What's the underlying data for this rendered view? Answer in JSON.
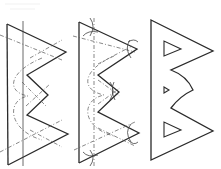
{
  "diagram": {
    "colors": {
      "stroke": "#2a2a2a",
      "guide": "#444444",
      "dashed": "#555555",
      "background": "#ffffff"
    },
    "figures": [
      {
        "id": "step-1",
        "label": "construction-lines",
        "outline": "7,24 66,52 27,75 48,95 27,115 68,134 8,165",
        "vertical_lines": [
          [
            7,
            24,
            8,
            165
          ],
          [
            23,
            22,
            23,
            165
          ]
        ],
        "dashed_diagonals": [
          [
            0,
            35,
            62,
            60
          ],
          [
            30,
            58,
            62,
            42
          ],
          [
            20,
            82,
            44,
            106
          ],
          [
            28,
            106,
            52,
            84
          ],
          [
            0,
            150,
            62,
            120
          ],
          [
            30,
            130,
            62,
            145
          ]
        ],
        "dashed_curve": "M 40 60 C 5 75, 5 95, 30 95 C 5 100, 5 130, 40 138"
      },
      {
        "id": "step-2",
        "label": "arc-marks",
        "outline": "79,22 137,49 98,75 119,92 98,112 139,133 79,163",
        "dashed_vertical": [
          94,
          18,
          94,
          165
        ],
        "dashed_diagonals": [
          [
            73,
            38,
            134,
            52
          ],
          [
            98,
            65,
            132,
            48
          ],
          [
            100,
            80,
            118,
            95
          ],
          [
            100,
            103,
            118,
            88
          ],
          [
            74,
            150,
            134,
            122
          ],
          [
            100,
            130,
            135,
            145
          ]
        ],
        "dashed_curve": "M 112 58 C 80 72, 80 90, 105 95 C 80 100, 80 128, 112 135"
      },
      {
        "id": "step-3",
        "label": "final-shape",
        "outline": "M 151 20 L 213 51 L 171 70 Q 186 78 193 90 Q 180 96 171 108 L 213 131 L 151 160 Z",
        "holes": [
          "164,41 164,56 181,49",
          "164,87 164,93 169,90",
          "164,122 164,137 181,130"
        ]
      }
    ]
  }
}
